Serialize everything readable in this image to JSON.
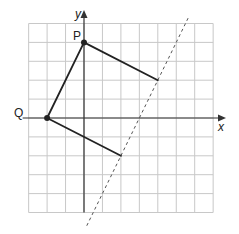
{
  "diagram": {
    "type": "coordinate-grid",
    "grid": {
      "x_min": -3,
      "x_max": 7,
      "y_min": -5,
      "y_max": 5,
      "step": 1
    },
    "axes": {
      "x_label": "x",
      "y_label": "y"
    },
    "points": [
      {
        "name": "P",
        "x": 0,
        "y": 4,
        "label": "P",
        "marked": true
      },
      {
        "name": "Q",
        "x": -2,
        "y": 0,
        "label": "Q",
        "marked": true
      }
    ],
    "segments": [
      {
        "from": [
          0,
          4
        ],
        "to": [
          -2,
          0
        ]
      },
      {
        "from": [
          0,
          4
        ],
        "to": [
          4,
          2
        ]
      },
      {
        "from": [
          -2,
          0
        ],
        "to": [
          2,
          -2
        ]
      }
    ],
    "dashed_line": {
      "equation": "y = 2x - 6",
      "from": [
        0.15,
        -5.7
      ],
      "to": [
        5.7,
        5.4
      ]
    },
    "colors": {
      "grid": "#c8c8c8",
      "axis": "#333333",
      "shape": "#222222",
      "dashed": "#555555"
    }
  }
}
